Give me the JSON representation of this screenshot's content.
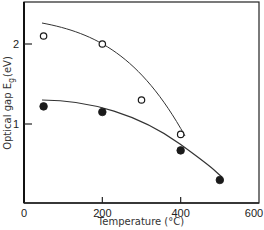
{
  "chart_data": {
    "type": "scatter",
    "title": "",
    "xlabel": "Temperature (°C)",
    "ylabel": "Optical gap E_g (eV)",
    "ylabel_parts": {
      "main": "Optical gap E",
      "sub": "g",
      "unit": "(eV)"
    },
    "xlim": [
      0,
      600
    ],
    "ylim": [
      0,
      2.5
    ],
    "x_ticks": [
      0,
      200,
      400,
      600
    ],
    "x_tick_labels": [
      "0",
      "200",
      "400",
      "600"
    ],
    "y_ticks": [
      1,
      2
    ],
    "y_tick_labels": [
      "1",
      "2"
    ],
    "grid": false,
    "legend": null,
    "series": [
      {
        "name": "open circles",
        "marker": "open-circle",
        "x": [
          50,
          200,
          300,
          400
        ],
        "y": [
          2.1,
          2.0,
          1.3,
          0.87
        ],
        "fit_curve": true
      },
      {
        "name": "filled circles",
        "marker": "filled-circle",
        "x": [
          50,
          200,
          400,
          500
        ],
        "y": [
          1.22,
          1.15,
          0.67,
          0.3
        ],
        "fit_curve": true
      }
    ]
  }
}
